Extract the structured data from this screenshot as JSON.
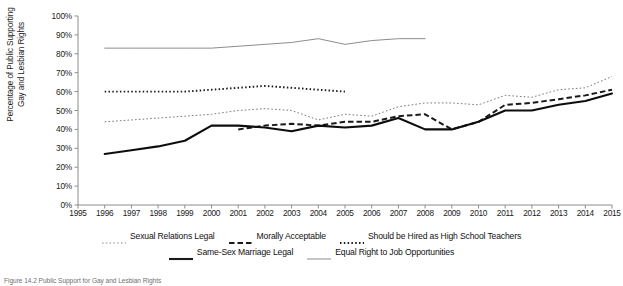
{
  "chart_data": {
    "type": "line",
    "title": "",
    "xlabel": "",
    "ylabel": "Percentage of Public Supporting Gay and Lesbian Rights",
    "xlim": [
      1995,
      2015
    ],
    "ylim": [
      0,
      100
    ],
    "grid": false,
    "legend_position": "bottom",
    "x_ticks": [
      "1995",
      "1996",
      "1997",
      "1998",
      "1999",
      "2000",
      "2001",
      "2002",
      "2003",
      "2004",
      "2005",
      "2006",
      "2007",
      "2008",
      "2009",
      "2010",
      "2011",
      "2012",
      "2013",
      "2014",
      "2015"
    ],
    "y_ticks": [
      "0%",
      "10%",
      "20%",
      "30%",
      "40%",
      "50%",
      "60%",
      "70%",
      "80%",
      "90%",
      "100%"
    ],
    "series": [
      {
        "name": "Sexual Relations Legal",
        "style": "dotted-fine",
        "color": "#7a7a7a",
        "x": [
          1996,
          1997,
          1998,
          1999,
          2000,
          2001,
          2002,
          2003,
          2004,
          2005,
          2006,
          2007,
          2008,
          2009,
          2010,
          2011,
          2012,
          2013,
          2014,
          2015
        ],
        "values": [
          44,
          45,
          46,
          47,
          48,
          50,
          51,
          50,
          45,
          48,
          47,
          52,
          54,
          54,
          53,
          58,
          57,
          61,
          62,
          68
        ]
      },
      {
        "name": "Morally Acceptable",
        "style": "dashed-bold",
        "color": "#1a1a1a",
        "x": [
          2001,
          2002,
          2003,
          2004,
          2005,
          2006,
          2007,
          2008,
          2009,
          2010,
          2011,
          2012,
          2013,
          2014,
          2015
        ],
        "values": [
          40,
          42,
          43,
          42,
          44,
          44,
          47,
          48,
          40,
          44,
          53,
          54,
          56,
          58,
          61
        ]
      },
      {
        "name": "Should be Hired as High School Teachers",
        "style": "dotted-bold",
        "color": "#1a1a1a",
        "x": [
          1996,
          1997,
          1998,
          1999,
          2000,
          2001,
          2002,
          2003,
          2004,
          2005
        ],
        "values": [
          60,
          60,
          60,
          60,
          61,
          62,
          63,
          62,
          61,
          60
        ]
      },
      {
        "name": "Same-Sex Marriage Legal",
        "style": "solid-bold",
        "color": "#0d0d0d",
        "x": [
          1996,
          1997,
          1998,
          1999,
          2000,
          2001,
          2002,
          2003,
          2004,
          2005,
          2006,
          2007,
          2008,
          2009,
          2010,
          2011,
          2012,
          2013,
          2014,
          2015
        ],
        "values": [
          27,
          29,
          31,
          34,
          42,
          42,
          41,
          39,
          42,
          41,
          42,
          46,
          40,
          40,
          44,
          50,
          50,
          53,
          55,
          59
        ]
      },
      {
        "name": "Equal Right to Job Opportunities",
        "style": "solid-thin",
        "color": "#8c8c8c",
        "x": [
          1996,
          1997,
          1998,
          1999,
          2000,
          2001,
          2002,
          2003,
          2004,
          2005,
          2006,
          2007,
          2008
        ],
        "values": [
          83,
          83,
          83,
          83,
          83,
          84,
          85,
          86,
          88,
          85,
          87,
          88,
          88
        ]
      }
    ]
  },
  "axis": {
    "y_title": "Percentage of Public Supporting Gay and Lesbian Rights",
    "y_title_line1": "Percentage of Public Supporting",
    "y_title_line2": "Gay and Lesbian Rights"
  },
  "legend": {
    "row1": [
      {
        "label": "Sexual Relations Legal",
        "style": "dotted-fine"
      },
      {
        "label": "Morally Acceptable",
        "style": "dashed-bold"
      },
      {
        "label": "Should be Hired as High School Teachers",
        "style": "dotted-bold"
      }
    ],
    "row2": [
      {
        "label": "Same-Sex Marriage Legal",
        "style": "solid-bold"
      },
      {
        "label": "Equal Right to Job Opportunities",
        "style": "solid-thin"
      }
    ]
  },
  "caption": {
    "text": "Figure 14.2  Public Support for Gay and Lesbian Rights"
  }
}
